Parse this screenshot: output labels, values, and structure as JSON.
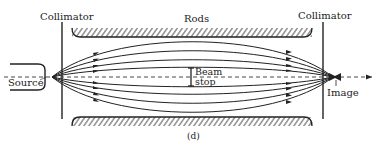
{
  "figure": {
    "panel_label": "(d)",
    "labels": {
      "collimator_left": "Collimator",
      "collimator_right": "Collimator",
      "rods": "Rods",
      "source": "Source",
      "image": "Image",
      "beam_stop_line1": "Beam",
      "beam_stop_line2": "stop"
    },
    "colors": {
      "ink": "#222222",
      "background": "#ffffff"
    }
  }
}
